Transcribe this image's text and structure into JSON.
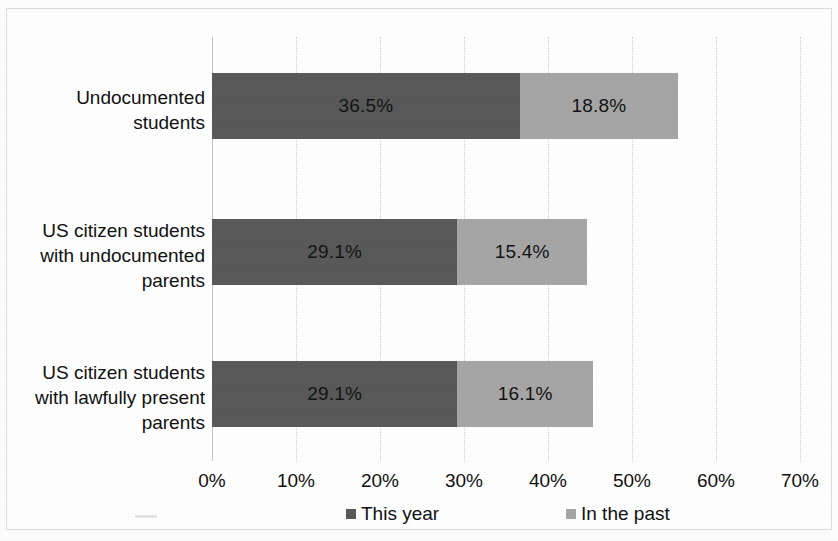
{
  "chart_data": {
    "type": "bar",
    "orientation": "horizontal",
    "stacked": true,
    "title": "",
    "subtitle": "",
    "xlabel": "",
    "ylabel": "",
    "xlim": [
      0,
      70
    ],
    "xticks": [
      "0%",
      "10%",
      "20%",
      "30%",
      "40%",
      "50%",
      "60%",
      "70%"
    ],
    "xtick_values": [
      0,
      10,
      20,
      30,
      40,
      50,
      60,
      70
    ],
    "grid": "vertical",
    "legend_position": "bottom",
    "categories": [
      "Undocumented students",
      "US citizen students with undocumented parents",
      "US citizen students with lawfully present parents"
    ],
    "category_label_lines": [
      [
        "Undocumented",
        "students"
      ],
      [
        "US citizen students",
        "with undocumented",
        "parents"
      ],
      [
        "US citizen students",
        "with lawfully present",
        "parents"
      ]
    ],
    "series": [
      {
        "name": "This year",
        "color": "#595959",
        "values": [
          36.5,
          29.1,
          29.1
        ],
        "labels": [
          "36.5%",
          "29.1%",
          "29.1%"
        ]
      },
      {
        "name": "In the past",
        "color": "#a6a6a6",
        "values": [
          18.8,
          15.4,
          16.1
        ],
        "labels": [
          "18.8%",
          "15.4%",
          "16.1%"
        ]
      }
    ],
    "totals": [
      55.3,
      44.5,
      45.2
    ]
  },
  "legend": {
    "items": [
      {
        "label": "This year",
        "color": "#595959"
      },
      {
        "label": "In the past",
        "color": "#a6a6a6"
      }
    ]
  },
  "colors": {
    "this_year": "#595959",
    "in_the_past": "#a6a6a6",
    "gridline": "#d2d2d2",
    "frame_border": "#dcdcdc",
    "text": "#111111",
    "background": "#ffffff"
  }
}
